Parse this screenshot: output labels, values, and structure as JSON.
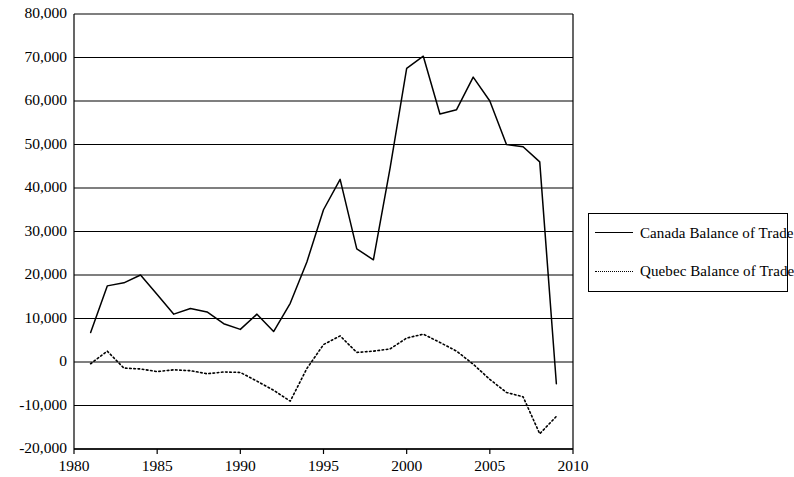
{
  "chart_data": {
    "type": "line",
    "title": "",
    "xlabel": "",
    "ylabel": "",
    "xlim": [
      1980,
      2010
    ],
    "ylim": [
      -20000,
      80000
    ],
    "grid": "horizontal",
    "legend_position": "right",
    "x_ticks": [
      "1980",
      "1985",
      "1990",
      "1995",
      "2000",
      "2005",
      "2010"
    ],
    "x_tick_values": [
      1980,
      1985,
      1990,
      1995,
      2000,
      2005,
      2010
    ],
    "y_ticks": [
      "-20,000",
      "-10,000",
      "0",
      "10,000",
      "20,000",
      "30,000",
      "40,000",
      "50,000",
      "60,000",
      "70,000",
      "80,000"
    ],
    "y_tick_values": [
      -20000,
      -10000,
      0,
      10000,
      20000,
      30000,
      40000,
      50000,
      60000,
      70000,
      80000
    ],
    "x": [
      1981,
      1982,
      1983,
      1984,
      1985,
      1986,
      1987,
      1988,
      1989,
      1990,
      1991,
      1992,
      1993,
      1994,
      1995,
      1996,
      1997,
      1998,
      1999,
      2000,
      2001,
      2002,
      2003,
      2004,
      2005,
      2006,
      2007,
      2008,
      2009
    ],
    "series": [
      {
        "name": "Canada Balance of Trade",
        "style": "solid",
        "values": [
          6800,
          17500,
          18200,
          20000,
          15500,
          11000,
          12300,
          11500,
          8800,
          7500,
          11000,
          7000,
          13500,
          23000,
          35000,
          42000,
          26000,
          23500,
          44500,
          67500,
          70300,
          57000,
          58000,
          65500,
          60000,
          50000,
          49500,
          46000,
          -5000
        ]
      },
      {
        "name": "Quebec Balance of Trade",
        "style": "dotted",
        "values": [
          -400,
          2500,
          -1400,
          -1600,
          -2200,
          -1800,
          -2000,
          -2700,
          -2300,
          -2400,
          -4400,
          -6500,
          -9000,
          -1500,
          4000,
          6000,
          2200,
          2500,
          3000,
          5500,
          6400,
          4500,
          2500,
          -500,
          -4000,
          -7000,
          -8000,
          -16500,
          -12500
        ]
      }
    ]
  },
  "legend": {
    "items": [
      {
        "label": "Canada Balance of Trade",
        "style": "solid"
      },
      {
        "label": "Quebec Balance of Trade",
        "style": "dotted"
      }
    ]
  }
}
